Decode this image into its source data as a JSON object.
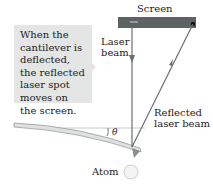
{
  "callout": {
    "text": "When the cantilever is deflected, the reflected laser spot moves on the screen."
  },
  "labels": {
    "screen": "Screen",
    "laser_beam_line1": "Laser",
    "laser_beam_line2": "beam",
    "reflected_line1": "Reflected",
    "reflected_line2": "laser beam",
    "theta": "θ",
    "atom": "Atom"
  },
  "colors": {
    "screen": "#5a5e5e",
    "beam": "#6a7070",
    "cantilever": "#d8dada",
    "callout_bg": "#e4e6e6",
    "atom": "#f2f2f2"
  }
}
